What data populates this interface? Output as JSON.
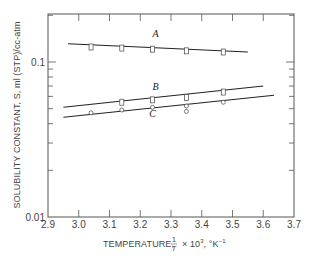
{
  "chart_data": {
    "type": "scatter",
    "title": "",
    "xlabel": "TEMPERATURE, 1/T × 10³, °K⁻¹",
    "xlabel_parts": {
      "prefix": "TEMPERATURE,",
      "frac_num": "1",
      "frac_den": "T",
      "suffix_mult": "× 10",
      "suffix_exp": "3",
      "suffix_unit": ", °K",
      "suffix_unit_exp": "−1"
    },
    "ylabel": "SOLUBILITY CONSTANT, S, ml (STP)/cc-atm",
    "xlim": [
      2.9,
      3.7
    ],
    "ylim": [
      0.01,
      0.2
    ],
    "yscale": "log",
    "grid": false,
    "legend": "inline labels",
    "x_ticks": [
      "2.9",
      "3.0",
      "3.1",
      "3.2",
      "3.3",
      "3.4",
      "3.5",
      "3.6",
      "3.7"
    ],
    "y_ticks": [
      "0.01",
      "0.1"
    ],
    "series": [
      {
        "name": "A",
        "marker": "square",
        "points": [
          {
            "x": 3.04,
            "y": 0.125
          },
          {
            "x": 3.14,
            "y": 0.123
          },
          {
            "x": 3.24,
            "y": 0.121
          },
          {
            "x": 3.35,
            "y": 0.118
          },
          {
            "x": 3.47,
            "y": 0.116
          }
        ],
        "fit_line": [
          {
            "x": 2.965,
            "y": 0.131
          },
          {
            "x": 3.55,
            "y": 0.116
          }
        ],
        "label_pos": {
          "x": 3.25,
          "y": 0.145
        }
      },
      {
        "name": "B",
        "marker": "square",
        "points": [
          {
            "x": 3.14,
            "y": 0.055
          },
          {
            "x": 3.24,
            "y": 0.057
          },
          {
            "x": 3.35,
            "y": 0.059
          },
          {
            "x": 3.47,
            "y": 0.064
          }
        ],
        "fit_line": [
          {
            "x": 2.95,
            "y": 0.051
          },
          {
            "x": 3.6,
            "y": 0.07
          }
        ],
        "label_pos": {
          "x": 3.25,
          "y": 0.066
        }
      },
      {
        "name": "C",
        "marker": "circle",
        "points": [
          {
            "x": 3.04,
            "y": 0.047
          },
          {
            "x": 3.14,
            "y": 0.049
          },
          {
            "x": 3.24,
            "y": 0.051
          },
          {
            "x": 3.35,
            "y": 0.052
          },
          {
            "x": 3.35,
            "y": 0.048
          },
          {
            "x": 3.47,
            "y": 0.055
          }
        ],
        "fit_line": [
          {
            "x": 2.95,
            "y": 0.044
          },
          {
            "x": 3.635,
            "y": 0.061
          }
        ],
        "label_pos": {
          "x": 3.24,
          "y": 0.044
        }
      }
    ]
  }
}
